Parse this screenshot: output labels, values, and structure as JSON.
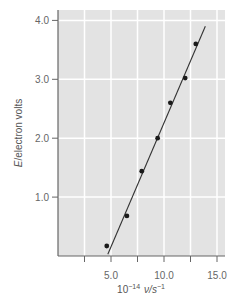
{
  "chart_data": {
    "type": "scatter",
    "title": "",
    "xlabel": "10^-14 ν/s^-1",
    "ylabel": "E/electron volts",
    "xlim": [
      0,
      15.5
    ],
    "ylim": [
      0,
      4.2
    ],
    "xticks": [
      5.0,
      10.0,
      15.0
    ],
    "xtick_labels": [
      "5.0",
      "10.0",
      "15.0"
    ],
    "x_minor_ticks": [
      2.5,
      7.5,
      12.5
    ],
    "yticks": [
      1.0,
      2.0,
      3.0,
      4.0
    ],
    "ytick_labels": [
      "1.0",
      "2.0",
      "3.0",
      "4.0"
    ],
    "grid": true,
    "legend": null,
    "series": [
      {
        "name": "measured points",
        "type": "scatter",
        "x": [
          4.6,
          6.5,
          7.9,
          9.4,
          10.6,
          12.0,
          13.0
        ],
        "y": [
          0.17,
          0.68,
          1.44,
          2.0,
          2.6,
          3.02,
          3.6
        ]
      },
      {
        "name": "fit line",
        "type": "line",
        "x": [
          4.7,
          13.9
        ],
        "y": [
          0.03,
          3.9
        ]
      }
    ]
  },
  "labels": {
    "y_title_italic": "E",
    "y_title_rest": "/electron volts",
    "x_title_prefix": "10",
    "x_title_exp": "−14",
    "x_title_nu": "ν",
    "x_title_unit": "/s",
    "x_title_unit_exp": "−1"
  },
  "colors": {
    "plot_bg": "#e3e3e3",
    "grid": "#ffffff",
    "axis": "#666666",
    "points": "#1a1a1a",
    "line": "#333333"
  }
}
